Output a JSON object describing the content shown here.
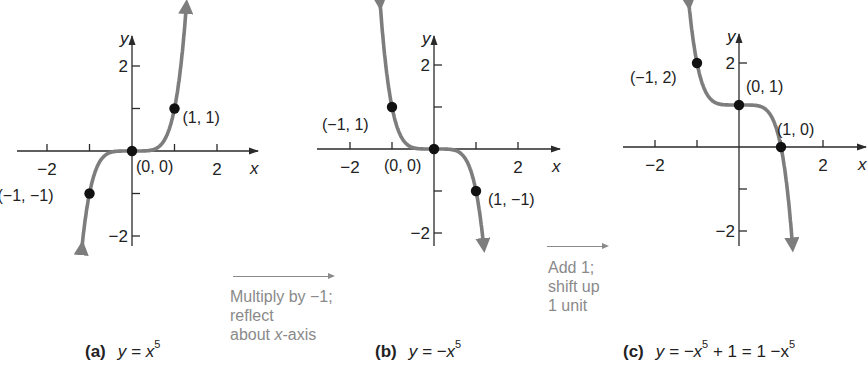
{
  "figure": {
    "panels": [
      {
        "id": "a",
        "caption_letter": "(a)",
        "caption_eq": "y = x",
        "caption_exp": "5",
        "function": "x^5",
        "origin_px": [
          132,
          151
        ],
        "unit_px": 42.5,
        "x_ticks": [
          -2,
          -1,
          1,
          2
        ],
        "y_ticks": [
          2,
          1,
          -1,
          -2
        ],
        "x_tick_labels": [
          {
            "v": -2,
            "text": "−2"
          },
          {
            "v": 2,
            "text": "2"
          }
        ],
        "y_tick_labels": [
          {
            "v": 2,
            "text": "2"
          },
          {
            "v": -2,
            "text": "−2"
          }
        ],
        "x_axis_range_px": [
          17,
          258
        ],
        "y_axis_range_px": [
          36,
          246
        ],
        "axis_x_label": "x",
        "axis_y_label": "y",
        "points": [
          {
            "x": -1,
            "y": -1,
            "label": "(−1, −1)",
            "label_dx": -92,
            "label_dy": 7
          },
          {
            "x": 0,
            "y": 0,
            "label": "(0, 0)",
            "label_dx": 4,
            "label_dy": 21
          },
          {
            "x": 1,
            "y": 1,
            "label": "(1, 1)",
            "label_dx": 8,
            "label_dy": 14
          }
        ]
      },
      {
        "id": "b",
        "caption_letter": "(b)",
        "caption_eq": "y =  −x",
        "caption_exp": "5",
        "function": "-x^5",
        "origin_px": [
          434,
          149
        ],
        "unit_px": 42.0,
        "x_ticks": [
          -2,
          -1,
          1,
          2
        ],
        "y_ticks": [
          2,
          1,
          -1,
          -2
        ],
        "x_tick_labels": [
          {
            "v": -2,
            "text": "−2"
          },
          {
            "v": 2,
            "text": "2"
          }
        ],
        "y_tick_labels": [
          {
            "v": 2,
            "text": "2"
          },
          {
            "v": -2,
            "text": "−2"
          }
        ],
        "x_axis_range_px": [
          317,
          560
        ],
        "y_axis_range_px": [
          36,
          246
        ],
        "axis_x_label": "x",
        "axis_y_label": "y",
        "points": [
          {
            "x": -1,
            "y": 1,
            "label": "(−1, 1)",
            "label_dx": -70,
            "label_dy": 23
          },
          {
            "x": 0,
            "y": 0,
            "label": "(0, 0)",
            "label_dx": -50,
            "label_dy": 22
          },
          {
            "x": 1,
            "y": -1,
            "label": "(1, −1)",
            "label_dx": 12,
            "label_dy": 14
          }
        ]
      },
      {
        "id": "c",
        "caption_letter": "(c)",
        "caption_eq": "y =  −x",
        "caption_exp": "5",
        "caption_rest": " + 1 = 1 −x",
        "caption_exp2": "5",
        "function": "-x^5+1",
        "origin_px": [
          739,
          147
        ],
        "unit_px": 42.0,
        "x_ticks": [
          -2,
          -1,
          1,
          2
        ],
        "y_ticks": [
          2,
          -1,
          -2
        ],
        "x_tick_labels": [
          {
            "v": -2,
            "text": "−2"
          },
          {
            "v": 2,
            "text": "2"
          }
        ],
        "y_tick_labels": [
          {
            "v": 2,
            "text": "2"
          },
          {
            "v": -2,
            "text": "−2"
          }
        ],
        "x_axis_range_px": [
          623,
          866
        ],
        "y_axis_range_px": [
          34,
          246
        ],
        "axis_x_label": "x",
        "axis_y_label": "y",
        "points": [
          {
            "x": -1,
            "y": 2,
            "label": "(−1, 2)",
            "label_dx": -67,
            "label_dy": 20
          },
          {
            "x": 0,
            "y": 1,
            "label": "(0, 1)",
            "label_dx": 7,
            "label_dy": -13
          },
          {
            "x": 1,
            "y": 0,
            "label": "(1, 0)",
            "label_dx": -4,
            "label_dy": -12
          }
        ]
      }
    ],
    "transforms": [
      {
        "lines": [
          "Multiply by −1;",
          "reflect",
          "about x-axis"
        ],
        "italic_word": "x"
      },
      {
        "lines": [
          "Add 1;",
          "shift up",
          "1 unit"
        ]
      }
    ],
    "colors": {
      "curve": "#7d7d7d",
      "point": "#111111",
      "axis": "#2a2a2a",
      "annotation": "#8a8a8a"
    }
  }
}
